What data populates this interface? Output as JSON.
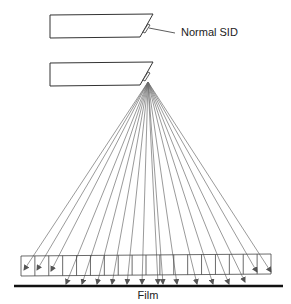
{
  "labels": {
    "normal_sid": "Normal SID",
    "film": "Film"
  },
  "colors": {
    "outline": "#333333",
    "rays": "#6e6e6e",
    "film": "#111111",
    "text": "#222222"
  },
  "diagram": {
    "tube_top": {
      "description": "x-ray tube at normal source-to-image distance"
    },
    "tube_bottom": {
      "description": "x-ray tube at shortened distance, emitting diverging rays"
    },
    "grid_cells": 18,
    "ray_count": 18
  }
}
